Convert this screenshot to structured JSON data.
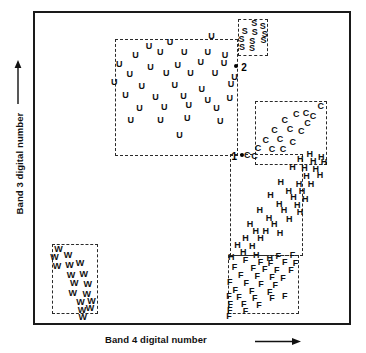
{
  "figure": {
    "type": "scatter",
    "background_color": "#ffffff",
    "frame_color": "#1a1a1a",
    "symbol_color": "#111111",
    "cluster_box_color": "#2a2a2a"
  },
  "axes": {
    "x": {
      "label": "Band 4 digital number",
      "arrow": "right-arrow",
      "ticks": [],
      "range_shown": false
    },
    "y": {
      "label": "Band 3 digital number",
      "arrow": "up-arrow",
      "ticks": [],
      "range_shown": false
    }
  },
  "chart_data": {
    "type": "scatter",
    "title": "",
    "xlabel": "Band 4 digital number",
    "ylabel": "Band 3 digital number",
    "xlim": [
      0,
      100
    ],
    "ylim": [
      0,
      100
    ],
    "grid": false,
    "legend": "none",
    "axis_ticks": "none",
    "note": "Point coordinates are normalized 0-100 percent of the plot frame; x increases right, y increases up. Each class is drawn as its letter glyph.",
    "series": [
      {
        "name": "U",
        "label": "U",
        "symbol": "U",
        "count": 35,
        "box": {
          "x": 25.5,
          "y": 54.0,
          "w": 39.0,
          "h": 37.5
        },
        "points": [
          [
            36.3,
            89.5
          ],
          [
            43.0,
            90.8
          ],
          [
            56.2,
            92.5
          ],
          [
            32.0,
            86.5
          ],
          [
            39.9,
            87.3
          ],
          [
            47.5,
            87.5
          ],
          [
            55.0,
            87.4
          ],
          [
            60.5,
            86.3
          ],
          [
            26.8,
            83.6
          ],
          [
            36.8,
            82.6
          ],
          [
            45.5,
            83.3
          ],
          [
            52.8,
            84.3
          ],
          [
            60.2,
            84.0
          ],
          [
            30.2,
            80.3
          ],
          [
            41.8,
            80.6
          ],
          [
            49.5,
            80.5
          ],
          [
            57.3,
            80.8
          ],
          [
            63.5,
            79.5
          ],
          [
            25.2,
            77.8
          ],
          [
            34.0,
            76.6
          ],
          [
            44.5,
            76.9
          ],
          [
            53.1,
            75.6
          ],
          [
            62.4,
            77.2
          ],
          [
            28.8,
            73.5
          ],
          [
            38.4,
            72.9
          ],
          [
            47.3,
            73.3
          ],
          [
            55.0,
            72.0
          ],
          [
            62.0,
            72.5
          ],
          [
            33.3,
            69.5
          ],
          [
            41.2,
            69.8
          ],
          [
            49.0,
            70.3
          ],
          [
            57.8,
            69.2
          ],
          [
            30.5,
            65.6
          ],
          [
            40.0,
            65.4
          ],
          [
            48.5,
            66.0
          ],
          [
            59.0,
            65.3
          ],
          [
            46.0,
            60.8
          ]
        ]
      },
      {
        "name": "S",
        "label": "S",
        "symbol": "S",
        "count": 9,
        "box": {
          "x": 64.8,
          "y": 86.0,
          "w": 9.5,
          "h": 12.0
        },
        "points": [
          [
            69.8,
            96.8
          ],
          [
            72.5,
            95.7
          ],
          [
            66.8,
            94.2
          ],
          [
            70.0,
            93.8
          ],
          [
            73.2,
            93.2
          ],
          [
            65.8,
            91.5
          ],
          [
            69.2,
            91.0
          ],
          [
            72.8,
            91.3
          ],
          [
            65.9,
            88.9
          ],
          [
            69.1,
            88.6
          ]
        ]
      },
      {
        "name": "C",
        "label": "C",
        "symbol": "C",
        "count": 17,
        "box": {
          "x": 70.0,
          "y": 51.0,
          "w": 23.0,
          "h": 20.5
        },
        "points": [
          [
            91.0,
            70.0
          ],
          [
            83.2,
            67.5
          ],
          [
            86.3,
            67.9
          ],
          [
            88.5,
            66.8
          ],
          [
            79.5,
            65.6
          ],
          [
            86.8,
            64.6
          ],
          [
            76.3,
            62.2
          ],
          [
            81.2,
            62.5
          ],
          [
            84.8,
            61.9
          ],
          [
            73.5,
            59.0
          ],
          [
            78.0,
            59.2
          ],
          [
            82.1,
            58.3
          ],
          [
            71.0,
            56.6
          ],
          [
            75.5,
            56.2
          ],
          [
            79.0,
            56.0
          ],
          [
            67.6,
            54.2
          ],
          [
            69.9,
            54.0
          ]
        ]
      },
      {
        "name": "H",
        "label": "H",
        "symbol": "H",
        "count": 38,
        "box": {
          "x": 62.0,
          "y": 21.5,
          "w": 23.5,
          "h": 33.0
        },
        "points": [
          [
            87.5,
            54.6
          ],
          [
            91.2,
            53.4
          ],
          [
            84.5,
            53.0
          ],
          [
            88.6,
            52.2
          ],
          [
            92.0,
            52.0
          ],
          [
            82.0,
            50.4
          ],
          [
            85.8,
            50.0
          ],
          [
            89.4,
            49.6
          ],
          [
            86.5,
            47.5
          ],
          [
            90.8,
            47.8
          ],
          [
            78.3,
            45.5
          ],
          [
            84.1,
            45.0
          ],
          [
            87.9,
            44.8
          ],
          [
            80.8,
            42.7
          ],
          [
            85.0,
            42.5
          ],
          [
            75.0,
            41.2
          ],
          [
            82.3,
            40.5
          ],
          [
            86.1,
            40.0
          ],
          [
            77.8,
            38.4
          ],
          [
            83.5,
            38.0
          ],
          [
            71.6,
            36.5
          ],
          [
            79.3,
            36.5
          ],
          [
            84.4,
            35.9
          ],
          [
            74.5,
            34.0
          ],
          [
            81.0,
            33.5
          ],
          [
            68.5,
            32.0
          ],
          [
            76.2,
            31.8
          ],
          [
            70.3,
            29.6
          ],
          [
            73.5,
            29.8
          ],
          [
            78.0,
            29.0
          ],
          [
            67.0,
            27.5
          ],
          [
            71.8,
            27.3
          ],
          [
            64.5,
            25.2
          ],
          [
            69.2,
            25.0
          ],
          [
            66.3,
            22.8
          ],
          [
            62.5,
            21.4
          ],
          [
            70.5,
            22.0
          ],
          [
            74.8,
            21.0
          ]
        ]
      },
      {
        "name": "F",
        "label": "F",
        "symbol": "F",
        "count": 36,
        "box": {
          "x": 61.5,
          "y": 3.0,
          "w": 22.5,
          "h": 19.0
        },
        "points": [
          [
            77.5,
            21.5
          ],
          [
            82.0,
            21.8
          ],
          [
            67.0,
            20.2
          ],
          [
            71.8,
            19.8
          ],
          [
            75.0,
            19.5
          ],
          [
            79.5,
            19.6
          ],
          [
            83.0,
            19.2
          ],
          [
            63.5,
            18.0
          ],
          [
            69.5,
            17.8
          ],
          [
            73.2,
            17.5
          ],
          [
            77.0,
            17.2
          ],
          [
            81.5,
            17.0
          ],
          [
            65.5,
            15.6
          ],
          [
            70.8,
            15.3
          ],
          [
            75.5,
            15.0
          ],
          [
            79.0,
            14.6
          ],
          [
            62.0,
            13.3
          ],
          [
            67.3,
            13.0
          ],
          [
            72.0,
            12.6
          ],
          [
            76.5,
            12.3
          ],
          [
            63.8,
            10.8
          ],
          [
            69.0,
            10.4
          ],
          [
            74.8,
            10.0
          ],
          [
            61.8,
            8.6
          ],
          [
            65.0,
            8.3
          ],
          [
            70.0,
            8.0
          ],
          [
            75.5,
            8.2
          ],
          [
            79.5,
            8.8
          ],
          [
            62.2,
            6.2
          ],
          [
            66.5,
            6.0
          ],
          [
            71.3,
            5.7
          ],
          [
            62.0,
            4.2
          ],
          [
            67.0,
            4.0
          ],
          [
            61.8,
            2.2
          ]
        ]
      },
      {
        "name": "W",
        "label": "W",
        "symbol": "W",
        "count": 17,
        "box": {
          "x": 5.5,
          "y": 3.0,
          "w": 14.5,
          "h": 22.5
        },
        "points": [
          [
            7.5,
            24.0
          ],
          [
            6.2,
            21.3
          ],
          [
            10.5,
            21.8
          ],
          [
            7.0,
            18.5
          ],
          [
            11.0,
            18.8
          ],
          [
            14.3,
            19.5
          ],
          [
            11.5,
            15.5
          ],
          [
            15.5,
            15.8
          ],
          [
            12.5,
            12.8
          ],
          [
            16.8,
            12.5
          ],
          [
            12.0,
            9.8
          ],
          [
            16.5,
            9.5
          ],
          [
            14.5,
            6.8
          ],
          [
            18.0,
            7.2
          ],
          [
            15.0,
            4.2
          ],
          [
            17.5,
            4.8
          ],
          [
            15.2,
            2.0
          ]
        ]
      }
    ],
    "annotations": [
      {
        "id": "point-1",
        "label": "1",
        "marker": "filled-dot",
        "x": 66.0,
        "y": 54.3,
        "label_side": "left",
        "description": "Reference pixel 1 near the lower-left corner of the C (corn) cluster"
      },
      {
        "id": "point-2",
        "label": "2",
        "marker": "filled-dot",
        "x": 64.0,
        "y": 83.0,
        "label_side": "right",
        "description": "Reference pixel 2 at the upper-right corner of the U (urban) cluster"
      }
    ]
  }
}
